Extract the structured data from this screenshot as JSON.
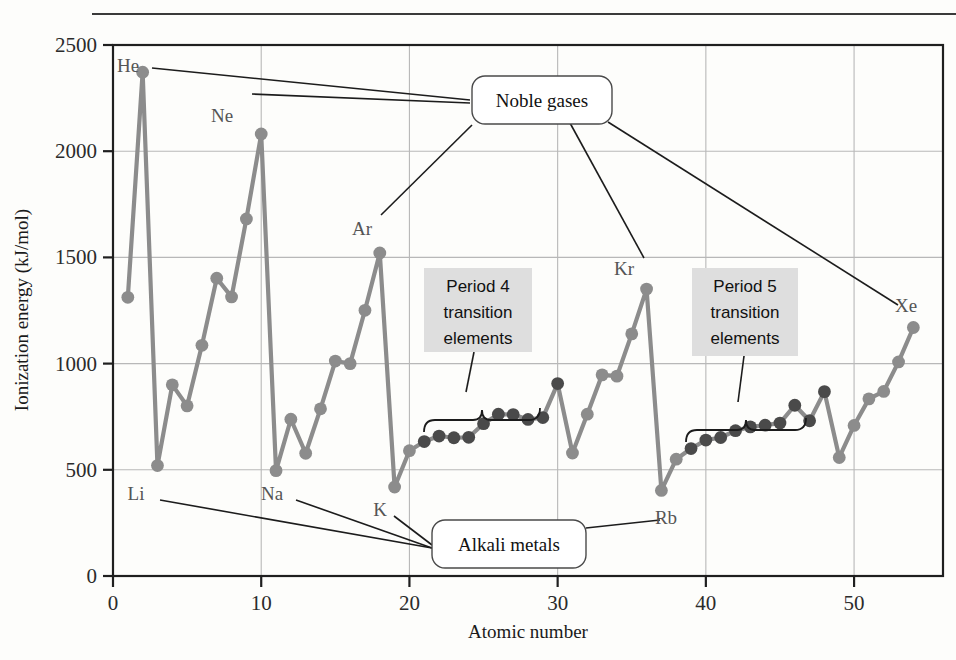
{
  "figure": {
    "partial_title": "",
    "axis": {
      "x_label": "Atomic number",
      "y_label": "Ionization energy (kJ/mol)",
      "x_ticks": [
        "0",
        "10",
        "20",
        "30",
        "40",
        "50"
      ],
      "y_ticks": [
        "0",
        "500",
        "1000",
        "1500",
        "2000",
        "2500"
      ]
    },
    "callouts": [
      {
        "id": "noble-gases",
        "label": "Noble gases",
        "style": "rounded-box"
      },
      {
        "id": "alkali-metals",
        "label": "Alkali metals",
        "style": "rounded-box"
      },
      {
        "id": "period-4",
        "label": "Period 4\ntranslation",
        "line1": "Period 4",
        "line2": "transition",
        "line3": "elements",
        "style": "gray-block"
      },
      {
        "id": "period-5",
        "label": "Period 5",
        "line1": "Period 5",
        "line2": "transition",
        "line3": "elements",
        "style": "gray-block"
      }
    ],
    "point_labels": [
      {
        "symbol": "He",
        "z": 2,
        "x": 128,
        "y": 72
      },
      {
        "symbol": "Ne",
        "z": 10,
        "x": 222,
        "y": 122
      },
      {
        "symbol": "Ar",
        "z": 18,
        "x": 362,
        "y": 235
      },
      {
        "symbol": "Kr",
        "z": 36,
        "x": 624,
        "y": 275
      },
      {
        "symbol": "Xe",
        "z": 54,
        "x": 906,
        "y": 312
      },
      {
        "symbol": "Li",
        "z": 3,
        "x": 136,
        "y": 500
      },
      {
        "symbol": "Na",
        "z": 11,
        "x": 272,
        "y": 500
      },
      {
        "symbol": "K",
        "z": 19,
        "x": 380,
        "y": 516
      },
      {
        "symbol": "Rb",
        "z": 37,
        "x": 666,
        "y": 524
      }
    ],
    "colors": {
      "main_line": "#8c8c8c",
      "transition_point": "#4a4a4a",
      "axis": "#1f1f1f",
      "grid": "#b8b8b8",
      "callout_fill": "#ffffff",
      "period_block_fill": "#dedede"
    }
  },
  "chart_data": {
    "type": "line",
    "title": "",
    "xlabel": "Atomic number",
    "ylabel": "Ionization energy (kJ/mol)",
    "xlim": [
      0,
      56
    ],
    "ylim": [
      0,
      2500
    ],
    "xticks": [
      0,
      10,
      20,
      30,
      40,
      50
    ],
    "yticks": [
      0,
      500,
      1000,
      1500,
      2000,
      2500
    ],
    "grid": true,
    "legend": false,
    "series": [
      {
        "name": "First ionization energy",
        "x": [
          1,
          2,
          3,
          4,
          5,
          6,
          7,
          8,
          9,
          10,
          11,
          12,
          13,
          14,
          15,
          16,
          17,
          18,
          19,
          20,
          21,
          22,
          23,
          24,
          25,
          26,
          27,
          28,
          29,
          30,
          31,
          32,
          33,
          34,
          35,
          36,
          37,
          38,
          39,
          40,
          41,
          42,
          43,
          44,
          45,
          46,
          47,
          48,
          49,
          50,
          51,
          52,
          53,
          54
        ],
        "values": [
          1312,
          2372,
          520,
          900,
          801,
          1086,
          1402,
          1314,
          1681,
          2081,
          496,
          738,
          578,
          787,
          1012,
          1000,
          1251,
          1521,
          419,
          590,
          633,
          659,
          651,
          653,
          717,
          762,
          760,
          737,
          746,
          906,
          579,
          762,
          947,
          941,
          1140,
          1351,
          403,
          550,
          600,
          640,
          652,
          684,
          702,
          710,
          720,
          804,
          731,
          868,
          558,
          709,
          834,
          869,
          1008,
          1170
        ],
        "symbols": [
          "H",
          "He",
          "Li",
          "Be",
          "B",
          "C",
          "N",
          "O",
          "F",
          "Ne",
          "Na",
          "Mg",
          "Al",
          "Si",
          "P",
          "S",
          "Cl",
          "Ar",
          "K",
          "Ca",
          "Sc",
          "Ti",
          "V",
          "Cr",
          "Mn",
          "Fe",
          "Co",
          "Ni",
          "Cu",
          "Zn",
          "Ga",
          "Ge",
          "As",
          "Se",
          "Br",
          "Kr",
          "Rb",
          "Sr",
          "Y",
          "Zr",
          "Nb",
          "Mo",
          "Tc",
          "Ru",
          "Rh",
          "Pd",
          "Ag",
          "Cd",
          "In",
          "Sn",
          "Sb",
          "Te",
          "I",
          "Xe"
        ]
      }
    ],
    "highlight_ranges": [
      {
        "name": "Period 4 transition elements",
        "from_z": 21,
        "to_z": 30
      },
      {
        "name": "Period 5 transition elements",
        "from_z": 39,
        "to_z": 48
      }
    ],
    "noble_gases": [
      2,
      10,
      18,
      36,
      54
    ],
    "alkali_metals": [
      3,
      11,
      19,
      37
    ],
    "annotations": [
      "Noble gases",
      "Alkali metals",
      "Period 4 transition elements",
      "Period 5 transition elements"
    ]
  }
}
